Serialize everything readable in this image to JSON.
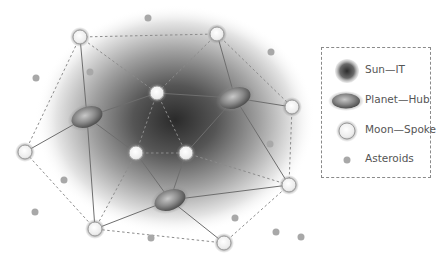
{
  "legend": {
    "items": [
      {
        "key": "sun",
        "label": "Sun—IT"
      },
      {
        "key": "planet",
        "label": "Planet—Hub"
      },
      {
        "key": "moon",
        "label": "Moon—Spoke"
      },
      {
        "key": "asteroid",
        "label": "Asteroids"
      }
    ]
  },
  "colors": {
    "sun_core": "#3a3a3a",
    "planet": "#8a8a8a",
    "moon_fill": "#f4f4f4",
    "moon_ring": "#9a9a9a",
    "asteroid": "#a8a8a8",
    "solid_edge": "#6e6e6e",
    "dashed_edge": "#8c8c8c"
  },
  "nodes": {
    "planets": [
      {
        "id": "P1",
        "x": 87,
        "y": 117
      },
      {
        "id": "P2",
        "x": 235,
        "y": 98
      },
      {
        "id": "P3",
        "x": 170,
        "y": 200
      }
    ],
    "moons": [
      {
        "id": "M1",
        "x": 80,
        "y": 37
      },
      {
        "id": "M2",
        "x": 217,
        "y": 34
      },
      {
        "id": "M3",
        "x": 292,
        "y": 107
      },
      {
        "id": "M4",
        "x": 25,
        "y": 152
      },
      {
        "id": "M5",
        "x": 157,
        "y": 93
      },
      {
        "id": "M6",
        "x": 136,
        "y": 153
      },
      {
        "id": "M7",
        "x": 186,
        "y": 153
      },
      {
        "id": "M8",
        "x": 289,
        "y": 185
      },
      {
        "id": "M9",
        "x": 95,
        "y": 229
      },
      {
        "id": "M10",
        "x": 224,
        "y": 243
      }
    ],
    "asteroids": [
      {
        "x": 148,
        "y": 18
      },
      {
        "x": 36,
        "y": 78
      },
      {
        "x": 90,
        "y": 72
      },
      {
        "x": 271,
        "y": 52
      },
      {
        "x": 270,
        "y": 144
      },
      {
        "x": 64,
        "y": 180
      },
      {
        "x": 35,
        "y": 212
      },
      {
        "x": 235,
        "y": 218
      },
      {
        "x": 276,
        "y": 232
      },
      {
        "x": 151,
        "y": 238
      },
      {
        "x": 301,
        "y": 237
      }
    ]
  },
  "edges": {
    "solid": [
      [
        "M1",
        "P1"
      ],
      [
        "M4",
        "P1"
      ],
      [
        "P1",
        "M5"
      ],
      [
        "P1",
        "M6"
      ],
      [
        "P1",
        "M9"
      ],
      [
        "M2",
        "P2"
      ],
      [
        "P2",
        "M3"
      ],
      [
        "P2",
        "M5"
      ],
      [
        "P2",
        "M7"
      ],
      [
        "P2",
        "M8"
      ],
      [
        "M6",
        "P3"
      ],
      [
        "M7",
        "P3"
      ],
      [
        "M9",
        "P3"
      ],
      [
        "P3",
        "M8"
      ],
      [
        "P3",
        "M10"
      ]
    ],
    "dashed": [
      [
        "M1",
        "M2"
      ],
      [
        "M2",
        "M3"
      ],
      [
        "M3",
        "M8"
      ],
      [
        "M8",
        "M10"
      ],
      [
        "M10",
        "M9"
      ],
      [
        "M9",
        "M4"
      ],
      [
        "M4",
        "M1"
      ],
      [
        "M1",
        "M5"
      ],
      [
        "M2",
        "M5"
      ],
      [
        "M5",
        "M6"
      ],
      [
        "M5",
        "M7"
      ],
      [
        "M6",
        "M7"
      ],
      [
        "M6",
        "M9"
      ],
      [
        "M7",
        "M8"
      ]
    ]
  },
  "sun_glow": {
    "cx": 175,
    "cy": 120,
    "rx": 140,
    "ry": 115
  }
}
